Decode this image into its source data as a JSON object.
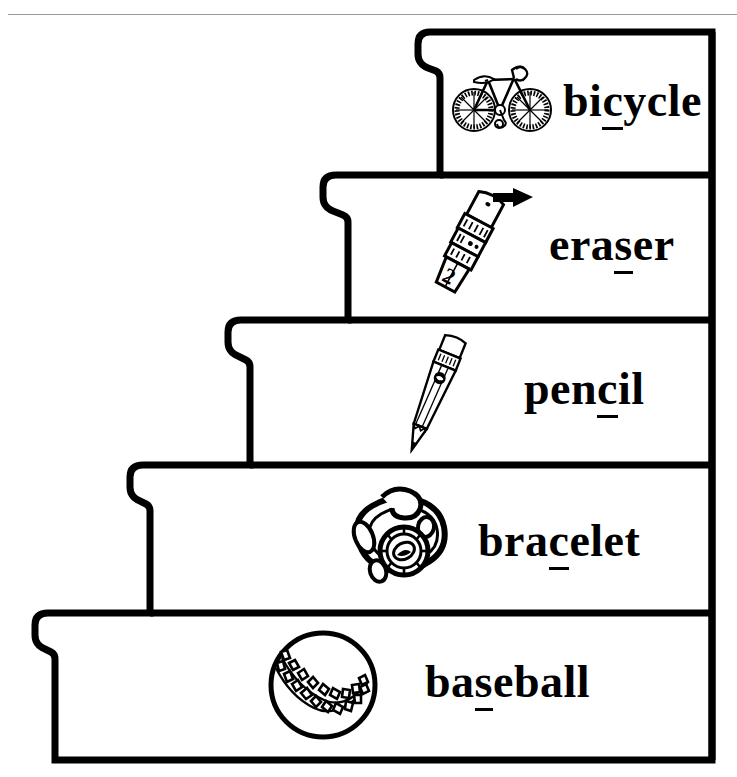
{
  "page": {
    "background_color": "#ffffff",
    "ink_color": "#000000",
    "rule_color": "#9a9a9a"
  },
  "staircase": {
    "outline_color": "#000000",
    "outline_width_px": 7,
    "step_count": 5,
    "direction": "ascending-left-to-right"
  },
  "steps": [
    {
      "index": 1,
      "position": "top",
      "word": "bicycle",
      "word_before": "bi",
      "word_underlined": "c",
      "word_after": "ycle",
      "image": "bicycle-illustration",
      "image_label": "bicycle"
    },
    {
      "index": 2,
      "position": "second",
      "word": "eraser",
      "word_before": "era",
      "word_underlined": "s",
      "word_after": "er",
      "image": "eraser-illustration",
      "image_label": "pencil-top eraser with arrow"
    },
    {
      "index": 3,
      "position": "middle",
      "word": "pencil",
      "word_before": "pen",
      "word_underlined": "c",
      "word_after": "il",
      "image": "pencil-illustration",
      "image_label": "pencil"
    },
    {
      "index": 4,
      "position": "fourth",
      "word": "bracelet",
      "word_before": "bra",
      "word_underlined": "c",
      "word_after": "elet",
      "image": "bracelet-illustration",
      "image_label": "bracelet"
    },
    {
      "index": 5,
      "position": "bottom",
      "word": "baseball",
      "word_before": "ba",
      "word_underlined": "s",
      "word_after": "eball",
      "image": "baseball-illustration",
      "image_label": "baseball"
    }
  ]
}
